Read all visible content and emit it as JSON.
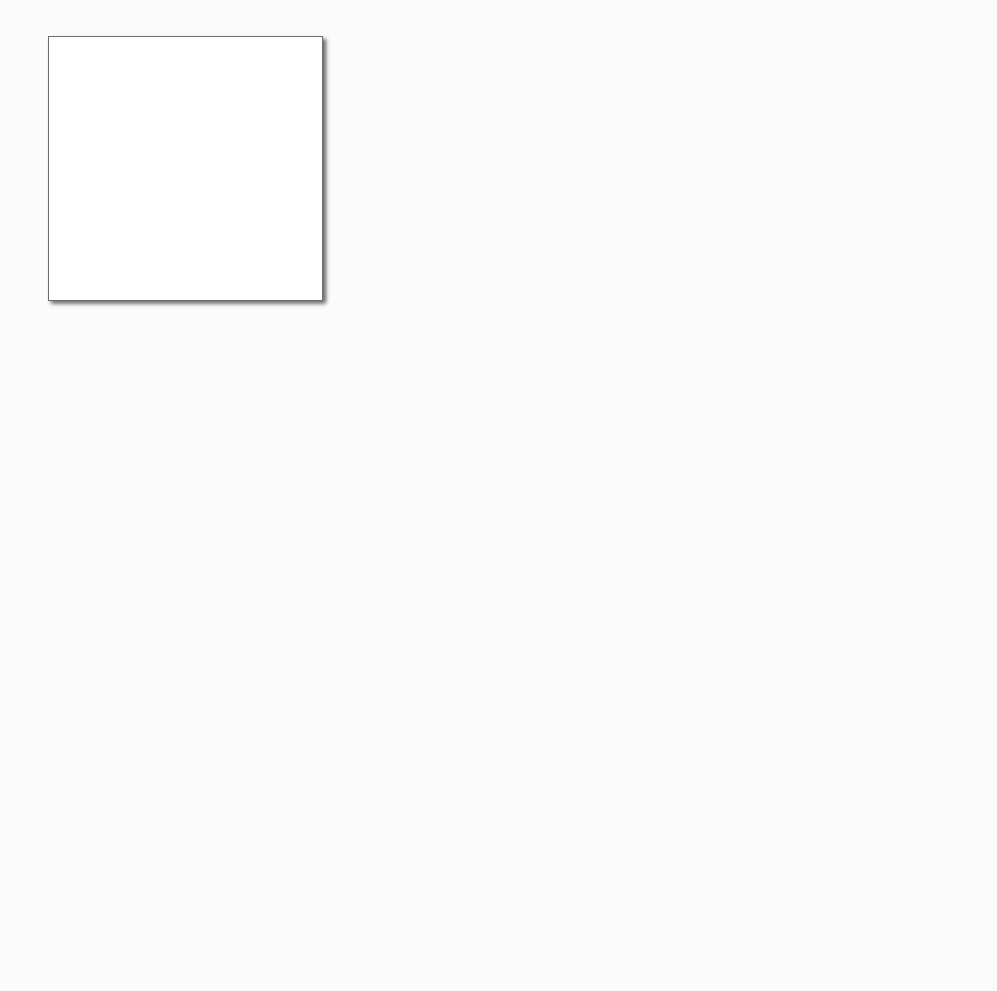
{
  "lanes": [
    {
      "title": "Customer"
    },
    {
      "title": "Travel Agency"
    },
    {
      "title": "Airline"
    }
  ],
  "customer": {
    "tasks": [
      {
        "label": "Request Plan Trip",
        "icon": "envelope-outline-icon"
      },
      {
        "label": "Request Trip Order",
        "icon": "envelope-outline-icon"
      },
      {
        "label": "Request Trip Order Confirmation",
        "icon": "hand-icon"
      },
      {
        "label": "Reply Plan Trip",
        "icon": "envelope-filled-icon"
      }
    ],
    "gateway": {
      "type": "exclusive",
      "icon": "x-icon"
    },
    "flow_labels": {
      "available": "Available",
      "not_available": "Not Available"
    },
    "end_event_label": "Response Plan Trip"
  },
  "agency": {
    "tasks": [
      {
        "label": "Request Trip Order",
        "icon": "envelope-outline-icon"
      },
      {
        "label": "Get Airline Price",
        "icon": "envelope-outline-icon"
      },
      {
        "label": "Reply Trip Order",
        "icon": "envelope-filled-icon"
      },
      {
        "label": "Request Trip Order Confirmation",
        "icon": "envelope-outline-icon"
      },
      {
        "label": "Book Flight",
        "icon": "envelope-outline-icon"
      },
      {
        "label": "Reply Trip Order Confirmation",
        "icon": "envelope-filled-icon"
      }
    ]
  },
  "airline": {
    "tasks": [
      {
        "label": "Request Price",
        "icon": "envelope-outline-icon"
      },
      {
        "label": "Calculate Price",
        "icon": "gear-icon"
      },
      {
        "label": "Reply Price",
        "icon": "envelope-filled-icon"
      },
      {
        "label": "Request Book Flight",
        "icon": "envelope-outline-icon"
      },
      {
        "label": "Make Reservation",
        "icon": "gear-icon"
      },
      {
        "label": "Reply Reservation Confirmation",
        "icon": "envelope-filled-icon"
      }
    ]
  },
  "caption": {
    "prefix": "Fig. 8.",
    "text": " Sample Business Process in BPMN notation"
  }
}
